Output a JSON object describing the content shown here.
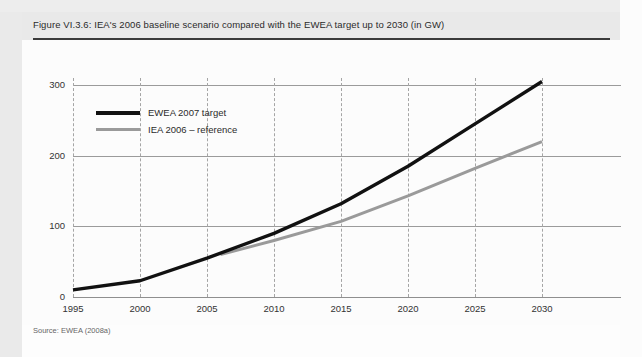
{
  "figure": {
    "caption": "Figure VI.3.6: IEA's 2006 baseline scenario compared with the EWEA target up to 2030 (in GW)",
    "source": "Source: EWEA (2008a)"
  },
  "legend": {
    "items": [
      {
        "label": "EWEA 2007 target",
        "color": "#111111",
        "style": "thick-black"
      },
      {
        "label": "IEA 2006 – reference",
        "color": "#9a9a9a",
        "style": "gray"
      }
    ]
  },
  "axis": {
    "y_ticks": [
      "0",
      "100",
      "200",
      "300"
    ],
    "x_ticks": [
      "1995",
      "2000",
      "2005",
      "2010",
      "2015",
      "2020",
      "2025",
      "2030"
    ]
  },
  "chart_data": {
    "type": "line",
    "title": "Figure VI.3.6: IEA's 2006 baseline scenario compared with the EWEA target up to 2030 (in GW)",
    "xlabel": "",
    "ylabel": "GW",
    "xlim": [
      1995,
      2030
    ],
    "ylim": [
      0,
      300
    ],
    "x": [
      1995,
      2000,
      2005,
      2010,
      2015,
      2020,
      2025,
      2030
    ],
    "y_ticks": [
      0,
      100,
      200,
      300
    ],
    "grid": {
      "horizontal": true,
      "vertical": true,
      "vertical_style": "dashed"
    },
    "legend_position": "upper-left-inside",
    "series": [
      {
        "name": "EWEA 2007 target",
        "color": "#111111",
        "x": [
          1995,
          2000,
          2005,
          2010,
          2015,
          2020,
          2025,
          2030
        ],
        "values": [
          10,
          23,
          55,
          90,
          132,
          185,
          245,
          305
        ]
      },
      {
        "name": "IEA 2006 – reference",
        "color": "#9a9a9a",
        "x": [
          2006,
          2010,
          2015,
          2020,
          2025,
          2030
        ],
        "values": [
          60,
          80,
          107,
          143,
          182,
          220
        ]
      }
    ],
    "source": "Source: EWEA (2008a)"
  }
}
